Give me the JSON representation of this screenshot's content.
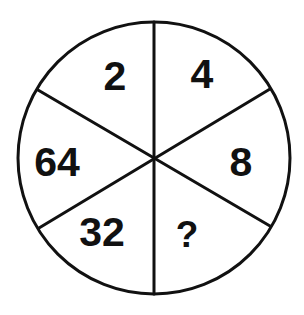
{
  "diagram": {
    "type": "number-wheel-puzzle",
    "segments": [
      {
        "position": "top-left",
        "value": "2"
      },
      {
        "position": "top-right",
        "value": "4"
      },
      {
        "position": "right",
        "value": "8"
      },
      {
        "position": "bottom-right",
        "value": "?"
      },
      {
        "position": "bottom-left",
        "value": "32"
      },
      {
        "position": "left",
        "value": "64"
      }
    ],
    "colors": {
      "stroke": "#111111",
      "text": "#111111",
      "background": "#ffffff"
    }
  }
}
